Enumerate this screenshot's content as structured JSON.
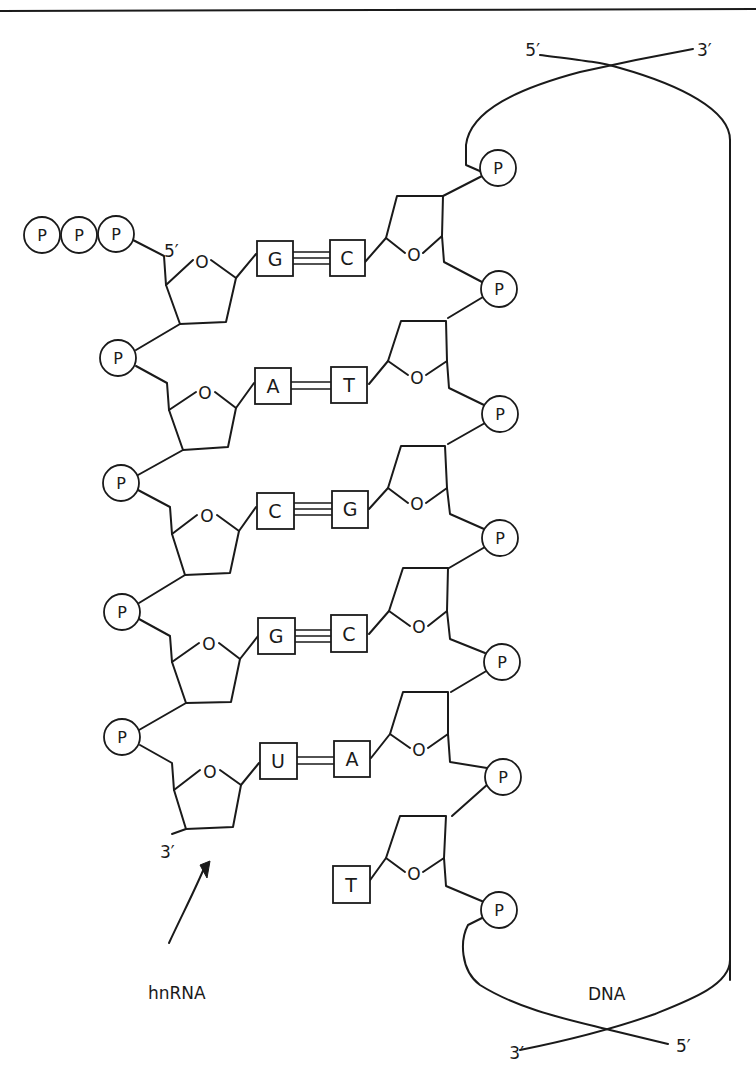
{
  "figure": {
    "labels": {
      "rna_name": "hnRNA",
      "dna_name": "DNA",
      "rna_5prime": "5′",
      "rna_3prime": "3′",
      "dna_top_left": "5′",
      "dna_top_right": "3′",
      "dna_bottom_left": "3′",
      "dna_bottom_right": "5′",
      "phosphate": "P",
      "ring_oxygen": "O"
    },
    "rna_triphosphate": [
      "P",
      "P",
      "P"
    ],
    "base_pairs": [
      {
        "rna": "G",
        "dna": "C",
        "bonds": 3
      },
      {
        "rna": "A",
        "dna": "T",
        "bonds": 2
      },
      {
        "rna": "C",
        "dna": "G",
        "bonds": 3
      },
      {
        "rna": "G",
        "dna": "C",
        "bonds": 3
      },
      {
        "rna": "U",
        "dna": "A",
        "bonds": 2
      }
    ],
    "dna_unpaired_base": "T",
    "rna_phosphates": [
      "P",
      "P",
      "P",
      "P"
    ],
    "dna_phosphates": [
      "P",
      "P",
      "P",
      "P",
      "P",
      "P",
      "P"
    ]
  }
}
